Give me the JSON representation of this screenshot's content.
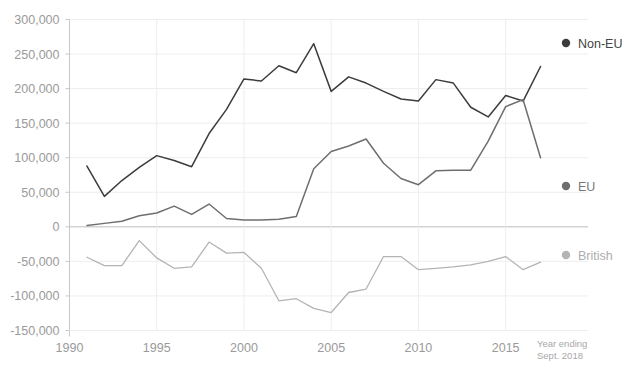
{
  "chart_data": {
    "type": "line",
    "title": "",
    "xlabel": "",
    "ylabel": "",
    "xlim": [
      1990,
      2018
    ],
    "ylim": [
      -150000,
      300000
    ],
    "grid": true,
    "legend_position": "right",
    "annotation": "Year ending Sept. 2018",
    "annotation_line1": "Year ending",
    "annotation_line2": "Sept. 2018",
    "ytick_labels": [
      "300,000",
      "250,000",
      "200,000",
      "150,000",
      "100,000",
      "50,000",
      "0",
      "-50,000",
      "-100,000",
      "-150,000"
    ],
    "ytick_values": [
      300000,
      250000,
      200000,
      150000,
      100000,
      50000,
      0,
      -50000,
      -100000,
      -150000
    ],
    "xtick_labels": [
      "1990",
      "1995",
      "2000",
      "2005",
      "2010",
      "2015"
    ],
    "xtick_values": [
      1990,
      1995,
      2000,
      2005,
      2010,
      2015
    ],
    "x": [
      1991,
      1992,
      1993,
      1994,
      1995,
      1996,
      1997,
      1998,
      1999,
      2000,
      2001,
      2002,
      2003,
      2004,
      2005,
      2006,
      2007,
      2008,
      2009,
      2010,
      2011,
      2012,
      2013,
      2014,
      2015,
      2016,
      2017
    ],
    "series": [
      {
        "name": "Non-EU",
        "color": "#3c3c3c",
        "values": [
          88000,
          44000,
          67000,
          86000,
          103000,
          96000,
          87000,
          135000,
          170000,
          214000,
          211000,
          233000,
          223000,
          265000,
          196000,
          217000,
          208000,
          196000,
          185000,
          182000,
          213000,
          208000,
          173000,
          159000,
          190000,
          182000,
          232000
        ]
      },
      {
        "name": "EU",
        "color": "#6e6e6e",
        "values": [
          2000,
          5000,
          8000,
          16000,
          20000,
          30000,
          18000,
          33000,
          12000,
          10000,
          10000,
          11000,
          15000,
          84000,
          109000,
          117000,
          127000,
          92000,
          70000,
          61000,
          81000,
          82000,
          82000,
          124000,
          174000,
          184000,
          100000
        ]
      },
      {
        "name": "British",
        "color": "#b4b4b4",
        "values": [
          -44000,
          -56000,
          -56000,
          -20000,
          -45000,
          -60000,
          -58000,
          -22000,
          -38000,
          -37000,
          -60000,
          -107000,
          -104000,
          -118000,
          -124000,
          -95000,
          -90000,
          -43000,
          -43000,
          -62000,
          -60000,
          -58000,
          -55000,
          -50000,
          -43000,
          -62000,
          -51000
        ]
      }
    ]
  },
  "legend": {
    "items": [
      {
        "label": "Non-EU",
        "color": "#3c3c3c",
        "text_color": "#444444"
      },
      {
        "label": "EU",
        "color": "#6e6e6e",
        "text_color": "#777777"
      },
      {
        "label": "British",
        "color": "#b4b4b4",
        "text_color": "#adadad"
      }
    ]
  }
}
